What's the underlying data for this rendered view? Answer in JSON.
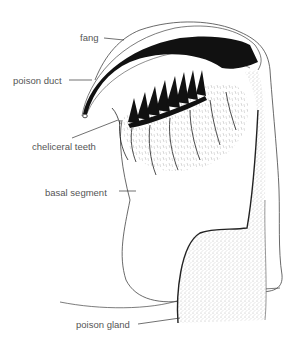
{
  "diagram": {
    "labels": [
      {
        "id": "fang",
        "text": "fang",
        "x": 80,
        "y": 33
      },
      {
        "id": "poison-duct",
        "text": "poison duct",
        "x": 13,
        "y": 76
      },
      {
        "id": "cheliceral-teeth",
        "text": "cheliceral teeth",
        "x": 32,
        "y": 142
      },
      {
        "id": "basal-segment",
        "text": "basal segment",
        "x": 45,
        "y": 188
      },
      {
        "id": "poison-gland",
        "text": "poison gland",
        "x": 76,
        "y": 320
      }
    ],
    "colors": {
      "ink": "#111111",
      "outline": "#444444",
      "label_text": "#555555",
      "stipple": "#888888"
    }
  }
}
